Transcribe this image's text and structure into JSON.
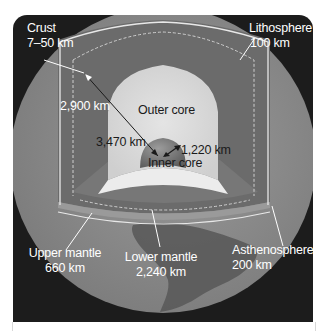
{
  "diagram": {
    "colors": {
      "background": "#1c1c1c",
      "crust_surface": "#8e8e8e",
      "mantle": "#6e6e6e",
      "outer_core": "#d9d9d9",
      "inner_core": "#7a7a7a",
      "label_light": "#ffffff",
      "label_dark": "#1a1a1a"
    },
    "labels": {
      "crust": {
        "name": "Crust",
        "value": "7–50 km"
      },
      "lithosphere": {
        "name": "Lithosphere",
        "value": "100 km"
      },
      "mantle_depth": {
        "value": "2,900 km"
      },
      "outer_core": {
        "name": "Outer core"
      },
      "outer_core_radius": {
        "value": "3,470 km"
      },
      "inner_core_radius": {
        "value": "1,220 km"
      },
      "inner_core": {
        "name": "Inner core"
      },
      "upper_mantle": {
        "name": "Upper mantle",
        "value": "660 km"
      },
      "lower_mantle": {
        "name": "Lower mantle",
        "value": "2,240 km"
      },
      "asthenosphere": {
        "name": "Asthenosphere",
        "value": "200 km"
      }
    }
  }
}
